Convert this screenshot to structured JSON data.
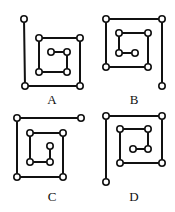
{
  "style": {
    "line_color": "#111111",
    "node_fill": "#ffffff",
    "node_stroke": "#111111",
    "line_width": 2,
    "node_radius": 3.2
  },
  "figures": [
    {
      "label": "A",
      "label_pos": [
        52,
        93
      ],
      "path": [
        [
          24,
          19
        ],
        [
          25,
          86
        ],
        [
          80,
          86
        ],
        [
          80,
          38
        ],
        [
          39,
          38
        ],
        [
          39,
          72
        ],
        [
          67,
          72
        ],
        [
          67,
          52
        ],
        [
          51,
          52
        ]
      ]
    },
    {
      "label": "B",
      "label_pos": [
        134,
        93
      ],
      "path": [
        [
          162,
          86
        ],
        [
          162,
          19
        ],
        [
          106,
          19
        ],
        [
          106,
          67
        ],
        [
          148,
          67
        ],
        [
          148,
          33
        ],
        [
          119,
          33
        ],
        [
          119,
          53
        ],
        [
          135,
          53
        ]
      ]
    },
    {
      "label": "C",
      "label_pos": [
        52,
        190
      ],
      "path": [
        [
          81,
          118
        ],
        [
          17,
          118
        ],
        [
          17,
          177
        ],
        [
          63,
          177
        ],
        [
          63,
          133
        ],
        [
          30,
          133
        ],
        [
          30,
          162
        ],
        [
          50,
          162
        ],
        [
          50,
          146
        ]
      ]
    },
    {
      "label": "D",
      "label_pos": [
        134,
        190
      ],
      "path": [
        [
          106,
          182
        ],
        [
          106,
          116
        ],
        [
          162,
          116
        ],
        [
          162,
          163
        ],
        [
          120,
          163
        ],
        [
          120,
          129
        ],
        [
          148,
          129
        ],
        [
          148,
          149
        ],
        [
          133,
          149
        ]
      ]
    }
  ]
}
